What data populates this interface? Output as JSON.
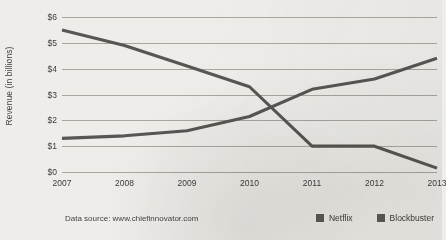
{
  "chart_data": {
    "type": "line",
    "title": "",
    "xlabel": "",
    "ylabel": "Revenue (in billions)",
    "categories": [
      "2007",
      "2008",
      "2009",
      "2010",
      "2011",
      "2012",
      "2013"
    ],
    "x": [
      2007,
      2008,
      2009,
      2010,
      2011,
      2012,
      2013
    ],
    "series": [
      {
        "name": "Netflix",
        "values": [
          1.3,
          1.4,
          1.6,
          2.15,
          3.2,
          3.6,
          4.4
        ]
      },
      {
        "name": "Blockbuster",
        "values": [
          5.5,
          4.9,
          4.1,
          3.3,
          1.0,
          1.0,
          0.15
        ]
      }
    ],
    "ylim": [
      0,
      6
    ],
    "ytick_values": [
      0,
      1,
      2,
      3,
      4,
      5,
      6
    ],
    "ytick_labels": [
      "$0",
      "$1",
      "$2",
      "$3",
      "$4",
      "$5",
      "$6"
    ],
    "grid": true,
    "legend_position": "bottom-right",
    "line_color": "#585553",
    "grid_color": "#a9a6a1",
    "background_color": "#eeedea"
  },
  "footer": {
    "data_source": "Data source: www.chiefinnovator.com"
  },
  "legend": {
    "items": [
      {
        "label": "Netflix",
        "color": "#5c5957"
      },
      {
        "label": "Blockbuster",
        "color": "#5c5957"
      }
    ]
  }
}
